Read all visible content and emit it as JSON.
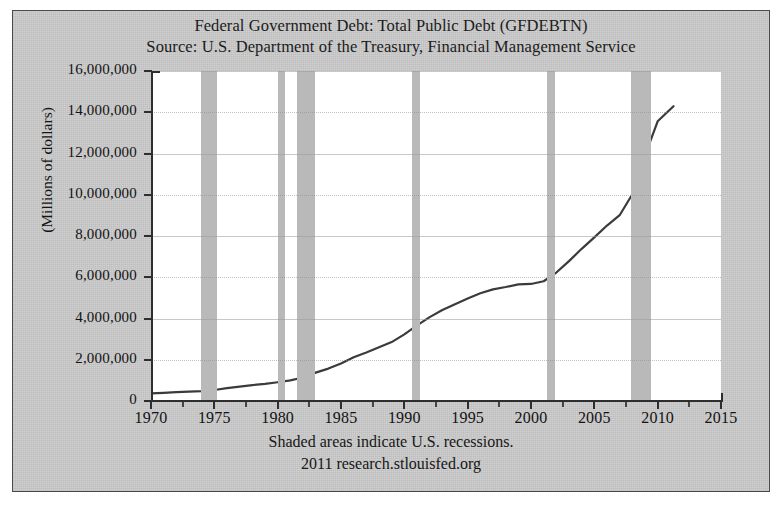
{
  "figure": {
    "title": "Federal Government Debt: Total Public Debt (GFDEBTN)",
    "source": "Source: U.S. Department of the Treasury, Financial Management Service",
    "footer_note": "Shaded areas indicate U.S. recessions.",
    "footer_credit": "2011 research.stlouisfed.org",
    "line_color": "#3b3b3b",
    "recession_color": "#b9b9b9",
    "plot_background": "#ffffff",
    "figure_background": "#cbcbcb"
  },
  "chart_data": {
    "type": "line",
    "title": "Federal Government Debt: Total Public Debt (GFDEBTN)",
    "subtitle": "Source: U.S. Department of the Treasury, Financial Management Service",
    "xlabel": "",
    "ylabel": "(Millions of dollars)",
    "xlim": [
      1970,
      2015
    ],
    "ylim": [
      0,
      16000000
    ],
    "grid": true,
    "legend": "none",
    "xticks": [
      1970,
      1975,
      1980,
      1985,
      1990,
      1995,
      2000,
      2005,
      2010,
      2015
    ],
    "xtick_labels": [
      "1970",
      "1975",
      "1980",
      "1985",
      "1990",
      "1995",
      "2000",
      "2005",
      "2010",
      "2015"
    ],
    "yticks": [
      0,
      2000000,
      4000000,
      6000000,
      8000000,
      10000000,
      12000000,
      14000000,
      16000000
    ],
    "ytick_labels": [
      "0",
      "2,000,000",
      "4,000,000",
      "6,000,000",
      "8,000,000",
      "10,000,000",
      "12,000,000",
      "14,000,000",
      "16,000,000"
    ],
    "series": [
      {
        "name": "Total Public Debt",
        "x": [
          1970,
          1971,
          1972,
          1973,
          1974,
          1975,
          1976,
          1977,
          1978,
          1979,
          1980,
          1981,
          1982,
          1983,
          1984,
          1985,
          1986,
          1987,
          1988,
          1989,
          1990,
          1991,
          1992,
          1993,
          1994,
          1995,
          1996,
          1997,
          1998,
          1999,
          2000,
          2001,
          2002,
          2003,
          2004,
          2005,
          2006,
          2007,
          2008,
          2009,
          2010,
          2011.25
        ],
        "values": [
          370000,
          398000,
          427000,
          458000,
          475000,
          533000,
          620000,
          698000,
          771000,
          826000,
          908000,
          998000,
          1142000,
          1377000,
          1572000,
          1823000,
          2125000,
          2350000,
          2602000,
          2857000,
          3233000,
          3665000,
          4065000,
          4411000,
          4693000,
          4974000,
          5225000,
          5413000,
          5526000,
          5656000,
          5674000,
          5807000,
          6228000,
          6783000,
          7379000,
          7933000,
          8507000,
          9008000,
          10025000,
          11910000,
          13562000,
          14290000
        ]
      }
    ],
    "recession_bands": [
      {
        "start": 1973.92,
        "end": 1975.25
      },
      {
        "start": 1980.0,
        "end": 1980.58
      },
      {
        "start": 1981.5,
        "end": 1982.92
      },
      {
        "start": 1990.58,
        "end": 1991.25
      },
      {
        "start": 2001.25,
        "end": 2001.92
      },
      {
        "start": 2007.92,
        "end": 2009.5
      }
    ],
    "annotations": [
      "Shaded areas indicate U.S. recessions.",
      "2011 research.stlouisfed.org"
    ]
  }
}
